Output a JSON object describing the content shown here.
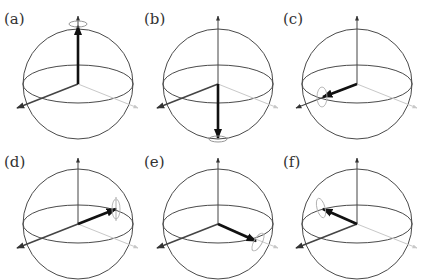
{
  "figure": {
    "colors": {
      "sphere": "#4a4a4a",
      "axis_dark": "#444444",
      "axis_light": "#c8c8c8",
      "state_vector": "#1a1a1a",
      "ring": "#9a9a9a"
    },
    "panels": [
      {
        "label": "(a)",
        "state": "+z",
        "cx": 78,
        "cy": 84,
        "tip": [
          0,
          -62
        ],
        "ring": "top"
      },
      {
        "label": "(b)",
        "state": "-z",
        "cx": 218,
        "cy": 84,
        "tip": [
          0,
          54
        ],
        "ring": "bottom"
      },
      {
        "label": "(c)",
        "state": "+x",
        "cx": 357,
        "cy": 84,
        "tip": [
          -34,
          13
        ],
        "ring": "side"
      },
      {
        "label": "(d)",
        "state": "+y",
        "cx": 78,
        "cy": 224,
        "tip": [
          38,
          -15
        ],
        "ring": "side"
      },
      {
        "label": "(e)",
        "state": "-x",
        "cx": 218,
        "cy": 224,
        "tip": [
          38,
          17
        ],
        "ring": "side"
      },
      {
        "label": "(f)",
        "state": "-y",
        "cx": 357,
        "cy": 224,
        "tip": [
          -34,
          -15
        ],
        "ring": "side"
      }
    ]
  }
}
